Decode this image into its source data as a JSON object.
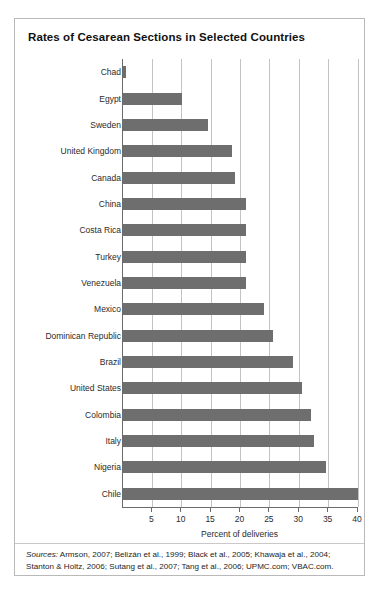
{
  "figure": {
    "title": "Rates of Cesarean Sections in Selected Countries",
    "sources_label": "Sources:",
    "sources_text": " Armson, 2007; Belizán et al., 1999; Black et al., 2005; Khawaja et al., 2004; Stanton & Holtz, 2006; Sutang et al., 2007; Tang et al., 2006; UPMC.com; VBAC.com.",
    "bar_color": "#6e6e6e",
    "gridline_color": "#c3c3c3",
    "axis_color": "#6b6b6b",
    "border_color": "#b9b9b9"
  },
  "chart_data": {
    "type": "bar",
    "orientation": "horizontal",
    "title": "Rates of Cesarean Sections in Selected Countries",
    "xlabel": "Percent of deliveries",
    "ylabel": "",
    "xlim": [
      0,
      40
    ],
    "xticks": [
      5,
      10,
      15,
      20,
      25,
      30,
      35,
      40
    ],
    "grid": true,
    "legend": false,
    "categories": [
      "Chad",
      "Egypt",
      "Sweden",
      "United Kingdom",
      "Canada",
      "China",
      "Costa Rica",
      "Turkey",
      "Venezuela",
      "Mexico",
      "Dominican Republic",
      "Brazil",
      "United States",
      "Colombia",
      "Italy",
      "Nigeria",
      "Chile"
    ],
    "values": [
      0.5,
      10,
      14.5,
      18.5,
      19,
      21,
      21,
      21,
      21,
      24,
      25.5,
      29,
      30.5,
      32,
      32.5,
      34.5,
      40
    ]
  }
}
